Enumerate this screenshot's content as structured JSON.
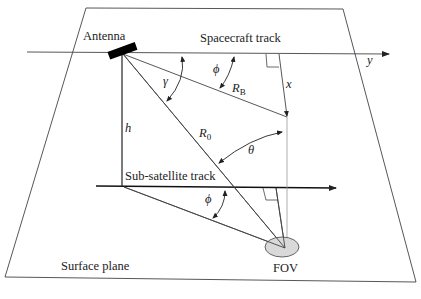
{
  "diagram": {
    "labels": {
      "antenna": "Antenna",
      "spacecraft_track": "Spacecraft track",
      "sub_satellite_track": "Sub-satellite track",
      "surface_plane": "Surface plane",
      "fov": "FOV"
    },
    "symbols": {
      "y": "y",
      "x": "x",
      "h": "h",
      "gamma": "γ",
      "phi_top": "ϕ",
      "phi_bottom": "ϕ",
      "theta": "θ",
      "R_B": "R",
      "R_B_sub": "B",
      "R_0": "R",
      "R_0_sub": "0"
    },
    "colors": {
      "line": "#333333",
      "thin_line": "#555555",
      "fov_fill": "#d9d9d9",
      "antenna": "#000000"
    }
  }
}
